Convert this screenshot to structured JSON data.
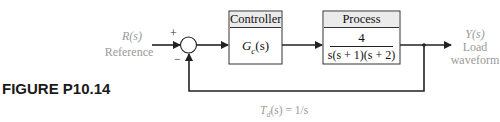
{
  "figure": {
    "label": "FIGURE P10.14"
  },
  "input": {
    "signal": "R(s)",
    "name": "Reference"
  },
  "summing_junction": {
    "plus_sign": "+",
    "minus_sign": "−"
  },
  "controller": {
    "title": "Controller",
    "transfer_function": "Gc(s)",
    "tf_main": "G",
    "tf_sub": "c",
    "tf_arg": "(s)"
  },
  "process": {
    "title": "Process",
    "numerator": "4",
    "denominator": "s(s + 1)(s + 2)"
  },
  "output": {
    "signal": "Y(s)",
    "name_line1": "Load",
    "name_line2": "waveform"
  },
  "disturbance": {
    "label": "Td(s) = 1/s",
    "main": "T",
    "sub": "d",
    "rest": "(s) = 1/s"
  },
  "colors": {
    "line": "#222222",
    "faint_text": "#9a9a9a",
    "header_fill": "#ebebeb"
  }
}
